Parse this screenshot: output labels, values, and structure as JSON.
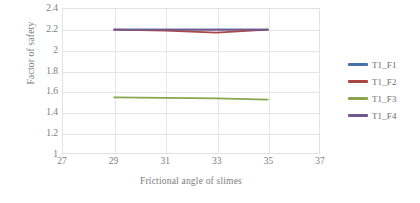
{
  "chart_data": {
    "type": "line",
    "title": "",
    "xlabel": "Frictional angle of slimes",
    "ylabel": "Factor of safety",
    "xlim": [
      27,
      37
    ],
    "ylim": [
      1,
      2.4
    ],
    "xticks": [
      27,
      29,
      31,
      33,
      35,
      37
    ],
    "yticks": [
      "1",
      "1.2",
      "1.4",
      "1.6",
      "1.8",
      "2",
      "2.2",
      "2.4"
    ],
    "grid": true,
    "legend_position": "right",
    "x": [
      29,
      31,
      33,
      35
    ],
    "series": [
      {
        "name": "T1_F1",
        "color": "#4572a7",
        "values": [
          2.2,
          2.2,
          2.2,
          2.2
        ]
      },
      {
        "name": "T1_F2",
        "color": "#aa4643",
        "values": [
          2.2,
          2.19,
          2.17,
          2.2
        ]
      },
      {
        "name": "T1_F3",
        "color": "#89a54e",
        "values": [
          1.54,
          1.535,
          1.53,
          1.52
        ]
      },
      {
        "name": "T1_F4",
        "color": "#71588f",
        "values": [
          2.2,
          2.2,
          2.2,
          2.2
        ]
      }
    ]
  },
  "legend": {
    "items": [
      {
        "label": "T1_F1",
        "color": "#4572a7"
      },
      {
        "label": "T1_F2",
        "color": "#aa4643"
      },
      {
        "label": "T1_F3",
        "color": "#89a54e"
      },
      {
        "label": "T1_F4",
        "color": "#71588f"
      }
    ]
  },
  "axes": {
    "y_title": "Factor of safety",
    "x_title": "Frictional angle of slimes",
    "y_tick_labels": [
      "2.4",
      "2.2",
      "2",
      "1.8",
      "1.6",
      "1.4",
      "1.2",
      "1"
    ],
    "x_tick_labels": [
      "27",
      "29",
      "31",
      "33",
      "35",
      "37"
    ]
  }
}
